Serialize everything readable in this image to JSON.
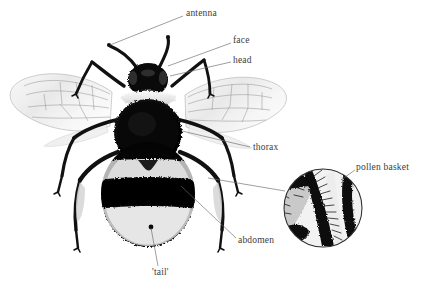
{
  "figure": {
    "style": "black-and-white engraving / halftone photograph with leader-line callouts",
    "background_color": "#ffffff",
    "label_color": "#3b3b3b",
    "leader_line_color": "#6b6b6b",
    "width": 428,
    "height": 291
  },
  "labels": [
    {
      "id": "antenna",
      "text": "antenna",
      "x": 186,
      "y": 9,
      "anchor": "start",
      "leader": {
        "from_x": 183,
        "from_y": 16,
        "to_x": 110,
        "to_y": 45
      }
    },
    {
      "id": "face",
      "text": "face",
      "x": 233,
      "y": 36,
      "anchor": "start",
      "leader": {
        "from_x": 231,
        "from_y": 43,
        "to_x": 168,
        "to_y": 66
      }
    },
    {
      "id": "head",
      "text": "head",
      "x": 233,
      "y": 56,
      "anchor": "start",
      "leader": {
        "from_x": 231,
        "from_y": 62,
        "to_x": 170,
        "to_y": 76
      }
    },
    {
      "id": "thorax",
      "text": "thorax",
      "x": 253,
      "y": 143,
      "anchor": "start",
      "leader": {
        "from_x": 250,
        "from_y": 147,
        "to_x": 182,
        "to_y": 131
      }
    },
    {
      "id": "abdomen",
      "text": "abdomen",
      "x": 238,
      "y": 236,
      "anchor": "start",
      "leader": {
        "from_x": 236,
        "from_y": 238,
        "to_x": 181,
        "to_y": 186
      }
    },
    {
      "id": "tail",
      "text": "'tail'",
      "x": 152,
      "y": 268,
      "anchor": "start",
      "leader": {
        "from_x": 158,
        "from_y": 266,
        "to_x": 151,
        "to_y": 228
      }
    },
    {
      "id": "pollen-basket",
      "text": "pollen basket",
      "x": 356,
      "y": 163,
      "anchor": "start",
      "leader": {
        "from_x": 355,
        "from_y": 170,
        "to_x": 341,
        "to_y": 180
      }
    }
  ],
  "inset": {
    "id": "pollen-basket-inset",
    "shape": "circle",
    "center_x": 323,
    "center_y": 208,
    "radius": 40,
    "border_color": "#2b2b2b",
    "description": "magnified detail of hind leg pollen basket (corbicula) with fringing hairs",
    "connector": {
      "from_x": 285,
      "from_y": 191,
      "to_x": 208,
      "to_y": 178
    }
  },
  "bee": {
    "center_x": 148,
    "center_y": 150,
    "parts": [
      "antenna",
      "face",
      "head",
      "thorax",
      "abdomen",
      "'tail'",
      "pollen basket",
      "wings",
      "legs"
    ]
  }
}
